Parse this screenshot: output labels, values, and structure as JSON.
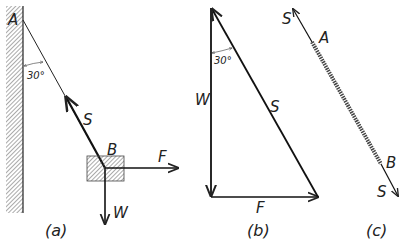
{
  "figure": {
    "panel_a": {
      "caption": "(a)",
      "point_top": "A",
      "point_block": "B",
      "angle": "30°",
      "force_rope": "S",
      "force_horizontal": "F",
      "force_weight": "W"
    },
    "panel_b": {
      "caption": "(b)",
      "angle": "30°",
      "side_vertical": "W",
      "side_hypotenuse": "S",
      "side_horizontal": "F"
    },
    "panel_c": {
      "caption": "(c)",
      "force_top": "S",
      "point_top": "A",
      "point_bottom": "B",
      "force_bottom": "S"
    }
  }
}
